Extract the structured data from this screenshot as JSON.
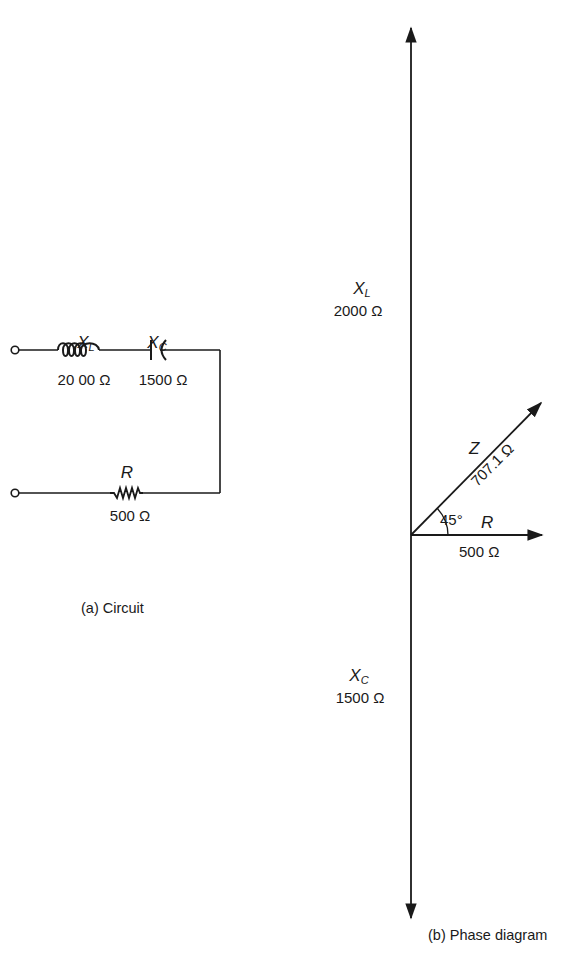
{
  "circuit": {
    "caption": "(a)  Circuit",
    "inductor": {
      "symbol": "X",
      "subscript": "L",
      "value": "20 00 Ω"
    },
    "capacitor": {
      "symbol": "X",
      "subscript": "C",
      "value": "1500 Ω"
    },
    "resistor": {
      "symbol": "R",
      "value": "500 Ω"
    }
  },
  "phase_diagram": {
    "caption": "(b)  Phase diagram",
    "xl": {
      "symbol": "X",
      "subscript": "L",
      "value": "2000 Ω"
    },
    "xc": {
      "symbol": "X",
      "subscript": "C",
      "value": "1500 Ω"
    },
    "z": {
      "symbol": "Z",
      "value": "707.1 Ω"
    },
    "r": {
      "symbol": "R",
      "value": "500 Ω"
    },
    "angle": "45°"
  },
  "colors": {
    "ink": "#1a1a1a",
    "background": "#ffffff"
  }
}
